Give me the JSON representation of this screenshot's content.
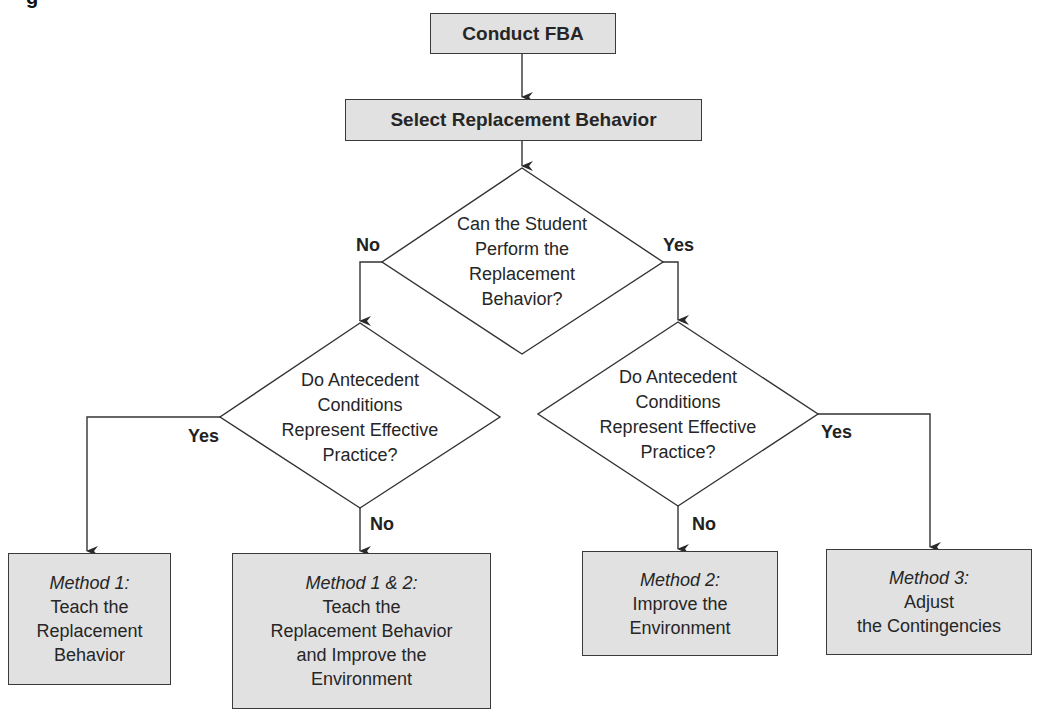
{
  "caption_fragment": "g",
  "flowchart": {
    "start": {
      "label": "Conduct FBA"
    },
    "step2": {
      "label": "Select Replacement Behavior"
    },
    "decision_main": {
      "lines": [
        "Can the Student",
        "Perform the",
        "Replacement",
        "Behavior?"
      ],
      "no_label": "No",
      "yes_label": "Yes"
    },
    "decision_left": {
      "lines": [
        "Do Antecedent",
        "Conditions",
        "Represent Effective",
        "Practice?"
      ],
      "yes_label": "Yes",
      "no_label": "No"
    },
    "decision_right": {
      "lines": [
        "Do Antecedent",
        "Conditions",
        "Represent Effective",
        "Practice?"
      ],
      "no_label": "No",
      "yes_label": "Yes"
    },
    "outcomes": [
      {
        "title": "Method 1:",
        "lines": [
          "Teach the",
          "Replacement",
          "Behavior"
        ]
      },
      {
        "title": "Method 1 & 2:",
        "lines": [
          "Teach the",
          "Replacement Behavior",
          "and Improve the",
          "Environment"
        ]
      },
      {
        "title": "Method 2:",
        "lines": [
          "Improve the",
          "Environment"
        ]
      },
      {
        "title": "Method 3:",
        "lines": [
          "Adjust",
          "the Contingencies"
        ]
      }
    ]
  },
  "colors": {
    "box_fill": "#e1e1e1",
    "line": "#333333",
    "text": "#262626"
  }
}
